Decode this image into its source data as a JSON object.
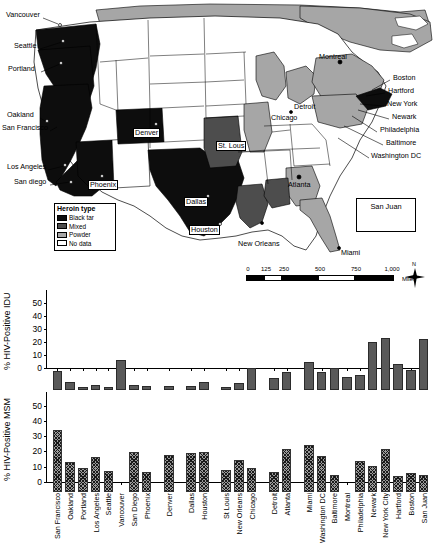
{
  "figure": {
    "panels": [
      "map",
      "idu-chart",
      "msm-chart"
    ]
  },
  "map": {
    "legend": {
      "title": "Heroin type",
      "items": [
        {
          "label": "Black tar",
          "color": "#0d0d0d"
        },
        {
          "label": "Mixed",
          "color": "#4d4d4d"
        },
        {
          "label": "Powder",
          "color": "#a6a6a6"
        },
        {
          "label": "No data",
          "color": "#ffffff"
        }
      ]
    },
    "inset": {
      "title": "San Juan"
    },
    "scalebar": {
      "ticks": [
        "0",
        "125",
        "250",
        "500",
        "750",
        "1,000"
      ],
      "unit": "Miles"
    },
    "compass": {
      "north": "N"
    },
    "left_labels": [
      {
        "name": "Vancouver",
        "x": 8,
        "y": 14
      },
      {
        "name": "Seattle",
        "x": 13,
        "y": 45
      },
      {
        "name": "Portland",
        "x": 8,
        "y": 68
      },
      {
        "name": "Oakland",
        "x": 8,
        "y": 114
      },
      {
        "name": "San Francisco",
        "x": 2,
        "y": 127
      },
      {
        "name": "Los Angeles",
        "x": 8,
        "y": 166
      },
      {
        "name": "San diego",
        "x": 13,
        "y": 181
      }
    ],
    "right_labels": [
      {
        "name": "Boston",
        "x": 392,
        "y": 77
      },
      {
        "name": "Hartford",
        "x": 387,
        "y": 90
      },
      {
        "name": "New York",
        "x": 386,
        "y": 103
      },
      {
        "name": "Newark",
        "x": 391,
        "y": 116
      },
      {
        "name": "Philadelphia",
        "x": 379,
        "y": 129
      },
      {
        "name": "Baltimore",
        "x": 385,
        "y": 142
      },
      {
        "name": "Washington DC",
        "x": 371,
        "y": 155
      }
    ],
    "boxed_labels": [
      {
        "name": "Denver",
        "x": 134,
        "y": 131
      },
      {
        "name": "St. Lous",
        "x": 218,
        "y": 143
      },
      {
        "name": "Phoenix",
        "x": 89,
        "y": 183
      },
      {
        "name": "Dallas",
        "x": 185,
        "y": 200
      },
      {
        "name": "Houston",
        "x": 190,
        "y": 228
      }
    ],
    "plain_labels": [
      {
        "name": "Montreal",
        "x": 320,
        "y": 56
      },
      {
        "name": "Detroit",
        "x": 296,
        "y": 106
      },
      {
        "name": "Chicago",
        "x": 272,
        "y": 117
      },
      {
        "name": "Atlanta",
        "x": 296,
        "y": 183
      },
      {
        "name": "New Orleans",
        "x": 240,
        "y": 243
      },
      {
        "name": "Miami",
        "x": 341,
        "y": 251
      }
    ]
  },
  "chart_data": [
    {
      "type": "bar",
      "id": "idu",
      "title": "",
      "ylabel": "% HIV-Positive IDU",
      "xlabel": "",
      "ylim": [
        0,
        55
      ],
      "yticks": [
        0,
        10,
        20,
        30,
        40,
        50
      ],
      "grid": false,
      "legend": "none",
      "bar_color": "#595959",
      "categories": [
        "San Francisco",
        "Oakland",
        "Portland",
        "Los Angeles",
        "Seattle",
        "Vancouver",
        "San Diego",
        "Phoenix",
        "Denver",
        "Dallas",
        "Houston",
        "St Louis",
        "New Orleans",
        "Chicago",
        "Detroit",
        "Atlanta",
        "Miami",
        "Washington DC",
        "Baltimore",
        "Montreal",
        "Philadelphia",
        "Newark",
        "New York City",
        "Hartford",
        "Boston",
        "San Juan"
      ],
      "values": [
        14.2,
        6.3,
        2.4,
        3.8,
        2.1,
        23.0,
        3.8,
        3.2,
        3.4,
        2.8,
        5.8,
        2.3,
        5.7,
        17.0,
        9.3,
        14.0,
        21.3,
        13.8,
        16.6,
        9.9,
        11.2,
        36.8,
        39.7,
        20.0,
        15.4,
        39.0
      ]
    },
    {
      "type": "bar",
      "id": "msm",
      "title": "",
      "ylabel": "% HIV-Positive MSM",
      "xlabel": "",
      "ylim": [
        0,
        55
      ],
      "yticks": [
        0,
        10,
        20,
        30,
        40,
        50
      ],
      "grid": false,
      "legend": "none",
      "bar_color": "#9a9a9a",
      "categories": [
        "San Francisco",
        "Oakland",
        "Portland",
        "Los Angeles",
        "Seattle",
        "Vancouver",
        "San Diego",
        "Phoenix",
        "Denver",
        "Dallas",
        "Houston",
        "St Louis",
        "New Orleans",
        "Chicago",
        "Detroit",
        "Atlanta",
        "Miami",
        "Washington DC",
        "Baltimore",
        "Montreal",
        "Philadelphia",
        "Newark",
        "New York City",
        "Hartford",
        "Boston",
        "San Juan"
      ],
      "values": [
        40.5,
        19.4,
        15.6,
        22.6,
        14.0,
        null,
        26.3,
        13.4,
        24.2,
        25.7,
        26.5,
        14.2,
        20.8,
        16.0,
        13.2,
        27.9,
        30.5,
        23.3,
        11.4,
        null,
        20.2,
        17.1,
        28.0,
        10.8,
        12.5,
        11.4
      ]
    }
  ]
}
